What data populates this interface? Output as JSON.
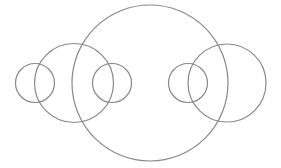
{
  "diagram": {
    "type": "circles",
    "background": "#ffffff",
    "stroke_color": "#888888",
    "stroke_width": 1.2,
    "circles": [
      {
        "name": "left-small-outer-circle",
        "cx": 35,
        "cy": 83,
        "r": 19.5
      },
      {
        "name": "left-medium-circle",
        "cx": 74,
        "cy": 83,
        "r": 39.5
      },
      {
        "name": "left-small-inner-circle",
        "cx": 112,
        "cy": 83,
        "r": 19.5
      },
      {
        "name": "center-large-circle",
        "cx": 150,
        "cy": 83,
        "r": 78
      },
      {
        "name": "right-small-inner-circle",
        "cx": 188,
        "cy": 83,
        "r": 19.5
      },
      {
        "name": "right-medium-circle",
        "cx": 227,
        "cy": 83,
        "r": 39
      }
    ]
  }
}
